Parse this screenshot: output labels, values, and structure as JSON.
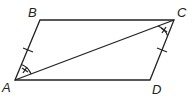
{
  "figure": {
    "type": "parallelogram-with-diagonal",
    "stroke_color": "#222222",
    "vertices": {
      "A": {
        "label": "A",
        "x": 15,
        "y": 80
      },
      "B": {
        "label": "B",
        "x": 40,
        "y": 20
      },
      "C": {
        "label": "C",
        "x": 174,
        "y": 20
      },
      "D": {
        "label": "D",
        "x": 150,
        "y": 80
      }
    },
    "sides": [
      "AB",
      "BC",
      "CD",
      "DA"
    ],
    "diagonal": "AC",
    "congruent_segment_marks": [
      "AB",
      "CD"
    ],
    "congruent_angle_marks": [
      "BAC",
      "DCA"
    ]
  }
}
